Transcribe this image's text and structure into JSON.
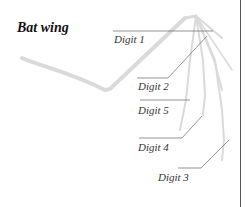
{
  "title": "Bat wing",
  "labels": {
    "digit1": "Digit 1",
    "digit2": "Digit 2",
    "digit5": "Digit 5",
    "digit4": "Digit 4",
    "digit3": "Digit 3"
  },
  "colors": {
    "bone": "#d9d9d9",
    "leader": "#555555",
    "text": "#333333"
  }
}
